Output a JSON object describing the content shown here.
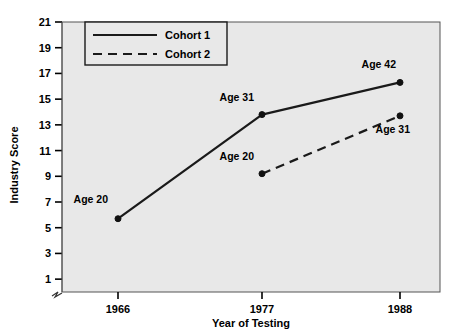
{
  "chart_data": {
    "type": "line",
    "title": "",
    "xlabel": "Year of Testing",
    "ylabel": "Industry Score",
    "x": [
      1966,
      1977,
      1988
    ],
    "categories": [
      "1966",
      "1977",
      "1988"
    ],
    "xtick_labels": [
      "1966",
      "1977",
      "1988"
    ],
    "ytick_labels": [
      "1",
      "3",
      "5",
      "7",
      "9",
      "11",
      "13",
      "15",
      "17",
      "19",
      "21"
    ],
    "yticks": [
      1,
      3,
      5,
      7,
      9,
      11,
      13,
      15,
      17,
      19,
      21
    ],
    "ylim": [
      0,
      21
    ],
    "grid": false,
    "legend_position": "top-left",
    "axis_break": true,
    "plot_background": "#e8e8e8",
    "line_color": "#1a1a1a",
    "series": [
      {
        "name": "Cohort 1",
        "style": "solid",
        "x": [
          1966,
          1977,
          1988
        ],
        "values": [
          5.7,
          13.8,
          16.3
        ],
        "point_labels": [
          "Age 20",
          "Age 31",
          "Age 42"
        ]
      },
      {
        "name": "Cohort 2",
        "style": "dashed",
        "x": [
          1977,
          1988
        ],
        "values": [
          9.2,
          13.7
        ],
        "point_labels": [
          "Age 20",
          "Age 31"
        ]
      }
    ],
    "annotations": [
      {
        "text": "Age 20",
        "series": "Cohort 1",
        "x": 1966,
        "value": 5.7
      },
      {
        "text": "Age 31",
        "series": "Cohort 1",
        "x": 1977,
        "value": 13.8
      },
      {
        "text": "Age 42",
        "series": "Cohort 1",
        "x": 1988,
        "value": 16.3
      },
      {
        "text": "Age 20",
        "series": "Cohort 2",
        "x": 1977,
        "value": 9.2
      },
      {
        "text": "Age 31",
        "series": "Cohort 2",
        "x": 1988,
        "value": 13.7
      }
    ],
    "legend": [
      {
        "label": "Cohort 1",
        "style": "solid"
      },
      {
        "label": "Cohort 2",
        "style": "dashed"
      }
    ]
  }
}
